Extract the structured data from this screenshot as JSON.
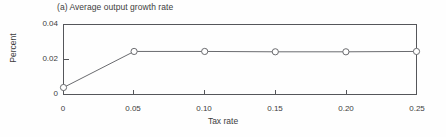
{
  "figure": {
    "panel_title": "(a) Average output growth rate",
    "background_color": "#fefefe",
    "axis_color": "#55565a",
    "line_color": "#6a6b6f",
    "marker_fill": "#ffffff",
    "text_color": "#3d3d3d"
  },
  "chart_data": {
    "type": "line",
    "title": "(a) Average output growth rate",
    "xlabel": "Tax rate",
    "ylabel": "Percent",
    "x": [
      0,
      0.05,
      0.1,
      0.15,
      0.2,
      0.25
    ],
    "values": [
      0.004,
      0.0246,
      0.0246,
      0.0244,
      0.0244,
      0.0246
    ],
    "series": [
      {
        "name": "Average output growth rate",
        "values": [
          0.004,
          0.0246,
          0.0246,
          0.0244,
          0.0244,
          0.0246
        ]
      }
    ],
    "xlim": [
      0,
      0.25
    ],
    "ylim": [
      0,
      0.04
    ],
    "xticks": [
      0,
      0.05,
      0.1,
      0.15,
      0.2,
      0.25
    ],
    "xtick_labels": [
      "0",
      "0.05",
      "0.10",
      "0.15",
      "0.20",
      "0.25"
    ],
    "yticks": [
      0,
      0.02,
      0.04
    ],
    "ytick_labels": [
      "0",
      "0.02",
      "0.04"
    ],
    "grid": false,
    "legend": null,
    "marker": "open-circle",
    "tick_direction": "in"
  }
}
